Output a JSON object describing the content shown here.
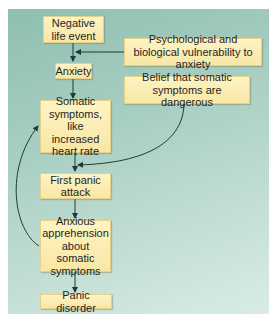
{
  "diagram": {
    "nodes": [
      {
        "id": "negative_life_event",
        "label": "Negative life event"
      },
      {
        "id": "vulnerability",
        "label": "Psychological and biological vulnerability to anxiety"
      },
      {
        "id": "anxiety",
        "label": "Anxiety"
      },
      {
        "id": "belief",
        "label": "Belief that somatic symptoms are dangerous"
      },
      {
        "id": "somatic_symptoms",
        "label": "Somatic symptoms, like increased heart rate"
      },
      {
        "id": "first_panic_attack",
        "label": "First panic attack"
      },
      {
        "id": "anxious_apprehension",
        "label": "Anxious apprehension about somatic symptoms"
      },
      {
        "id": "panic_disorder",
        "label": "Panic disorder"
      }
    ],
    "edges": [
      {
        "from": "negative_life_event",
        "to": "anxiety"
      },
      {
        "from": "vulnerability",
        "to": "negative_life_event->anxiety"
      },
      {
        "from": "anxiety",
        "to": "somatic_symptoms"
      },
      {
        "from": "belief",
        "to": "somatic_symptoms->first_panic_attack"
      },
      {
        "from": "somatic_symptoms",
        "to": "first_panic_attack"
      },
      {
        "from": "first_panic_attack",
        "to": "anxious_apprehension"
      },
      {
        "from": "anxious_apprehension",
        "to": "somatic_symptoms",
        "style": "curved-feedback"
      },
      {
        "from": "anxious_apprehension",
        "to": "panic_disorder"
      }
    ],
    "colors": {
      "box_fill": "#f9e9a9",
      "box_border": "#e7d08a",
      "background_top": "#8ebfb1",
      "background_bottom": "#d9ece6",
      "arrow": "#1e3a34"
    }
  }
}
